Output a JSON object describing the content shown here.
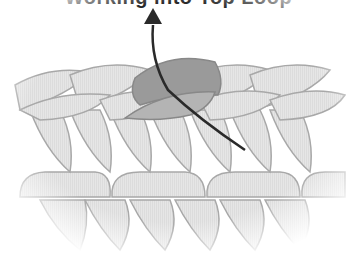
{
  "heading": {
    "text": "Working into Top Loop",
    "note": "heading partially cut off at top edge; only descenders visible"
  },
  "diagram": {
    "colors": {
      "background": "#ffffff",
      "stitch_fill": "#e4e4e4",
      "stitch_stroke": "#a8a8a8",
      "highlight_fill": "#9a9a9a",
      "highlight_fill_light": "#b4b4b4",
      "arrow": "#2a2a2a"
    },
    "elements": [
      {
        "name": "top-chain-row",
        "description": "braided chain of top loops"
      },
      {
        "name": "highlighted-loop",
        "description": "darker grey loop being worked"
      },
      {
        "name": "hook-path-arrow",
        "description": "dark arrow pointing upward through loop"
      },
      {
        "name": "middle-stitch-row",
        "description": "row of rounded stitches"
      },
      {
        "name": "lower-stitch-row",
        "description": "row of V-shaped stitch legs"
      }
    ]
  }
}
